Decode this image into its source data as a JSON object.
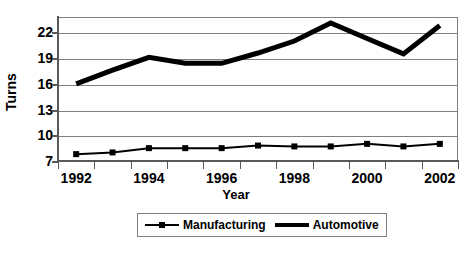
{
  "chart_data": {
    "type": "line",
    "title": "",
    "xlabel": "Year",
    "ylabel": "Turns",
    "categories": [
      "1992",
      "1993",
      "1994",
      "1995",
      "1996",
      "1997",
      "1998",
      "1999",
      "2000",
      "2001",
      "2002"
    ],
    "x_tick_labels": [
      "1992",
      "1994",
      "1996",
      "1998",
      "2000",
      "2002"
    ],
    "y_tick_labels": [
      "22",
      "19",
      "16",
      "13",
      "10",
      "7"
    ],
    "ylim": [
      7,
      23.8
    ],
    "yticks": [
      7,
      10,
      13,
      16,
      19,
      22
    ],
    "grid": "horizontal",
    "legend_position": "bottom",
    "series": [
      {
        "name": "Manufacturing",
        "marker": "square",
        "line_width": 2,
        "color": "#000000",
        "values": [
          7.8,
          8.0,
          8.5,
          8.5,
          8.5,
          8.8,
          8.7,
          8.7,
          9.0,
          8.7,
          9.0
        ]
      },
      {
        "name": "Automotive",
        "marker": "none",
        "line_width": 5,
        "color": "#000000",
        "values": [
          16.0,
          17.6,
          19.1,
          18.4,
          18.4,
          19.6,
          21.0,
          23.1,
          21.3,
          19.5,
          22.8
        ]
      }
    ]
  },
  "axes": {
    "y_title": "Turns",
    "x_title": "Year"
  },
  "legend": {
    "items": [
      {
        "label": "Manufacturing",
        "key": "line-with-square-marker"
      },
      {
        "label": "Automotive",
        "key": "thick-line"
      }
    ]
  },
  "colors": {
    "series": "#000000",
    "gridline": "#808080",
    "axis": "#595959",
    "background": "#ffffff"
  }
}
